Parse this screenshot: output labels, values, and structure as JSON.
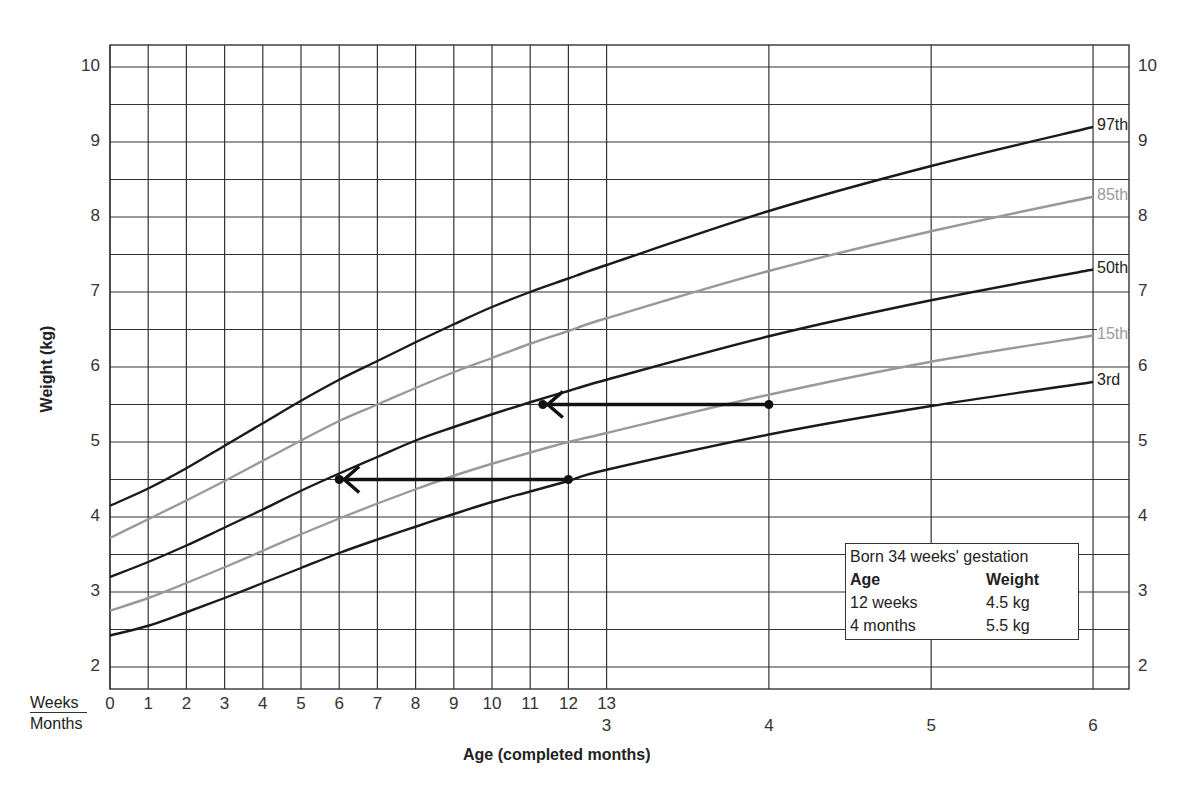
{
  "chart_data": {
    "type": "line",
    "title": "",
    "xlabel": "Age (completed months)",
    "ylabel": "Weight (kg)",
    "ylim": [
      1.7,
      10.3
    ],
    "grid": true,
    "y_ticks": [
      2,
      3,
      4,
      5,
      6,
      7,
      8,
      9,
      10
    ],
    "x_axis_rows": {
      "weeks_label": "Weeks",
      "months_label": "Months",
      "week_ticks": [
        "0",
        "1",
        "2",
        "3",
        "4",
        "5",
        "6",
        "7",
        "8",
        "9",
        "10",
        "11",
        "12",
        "13"
      ],
      "month_ticks": [
        "3",
        "4",
        "5",
        "6"
      ]
    },
    "x_unit": "weeks",
    "x": [
      0,
      1,
      2,
      3,
      4,
      5,
      6,
      7,
      8,
      9,
      10,
      11,
      12,
      13,
      17.33,
      21.67,
      26
    ],
    "series": [
      {
        "name": "97th",
        "color": "#1a1a1a",
        "values": [
          4.15,
          4.38,
          4.65,
          4.95,
          5.25,
          5.55,
          5.83,
          6.08,
          6.33,
          6.57,
          6.8,
          7.0,
          7.18,
          7.36,
          8.08,
          8.68,
          9.2
        ]
      },
      {
        "name": "85th",
        "color": "#999999",
        "values": [
          3.72,
          3.97,
          4.22,
          4.48,
          4.75,
          5.02,
          5.28,
          5.5,
          5.72,
          5.93,
          6.12,
          6.31,
          6.48,
          6.65,
          7.28,
          7.81,
          8.27
        ]
      },
      {
        "name": "50th",
        "color": "#1a1a1a",
        "values": [
          3.2,
          3.4,
          3.62,
          3.86,
          4.1,
          4.35,
          4.58,
          4.8,
          5.02,
          5.2,
          5.37,
          5.53,
          5.68,
          5.83,
          6.41,
          6.89,
          7.3
        ]
      },
      {
        "name": "15th",
        "color": "#999999",
        "values": [
          2.75,
          2.92,
          3.12,
          3.33,
          3.55,
          3.77,
          3.98,
          4.18,
          4.37,
          4.55,
          4.71,
          4.86,
          5.0,
          5.12,
          5.63,
          6.07,
          6.42
        ]
      },
      {
        "name": "3rd",
        "color": "#1a1a1a",
        "values": [
          2.42,
          2.55,
          2.73,
          2.92,
          3.12,
          3.32,
          3.52,
          3.7,
          3.87,
          4.04,
          4.2,
          4.34,
          4.48,
          4.63,
          5.1,
          5.48,
          5.8
        ]
      }
    ],
    "annotations": [
      {
        "type": "arrow",
        "from_week": 12,
        "to_week": 6,
        "weight_kg": 4.5,
        "label": "12 weeks corrected by 6 weeks"
      },
      {
        "type": "arrow",
        "from_week": 17.33,
        "to_week": 11.33,
        "weight_kg": 5.5,
        "label": "4 months corrected by 6 weeks"
      }
    ],
    "info_box": {
      "title": "Born 34 weeks' gestation",
      "headers": [
        "Age",
        "Weight"
      ],
      "rows": [
        [
          "12 weeks",
          "4.5 kg"
        ],
        [
          "4 months",
          "5.5 kg"
        ]
      ]
    }
  }
}
